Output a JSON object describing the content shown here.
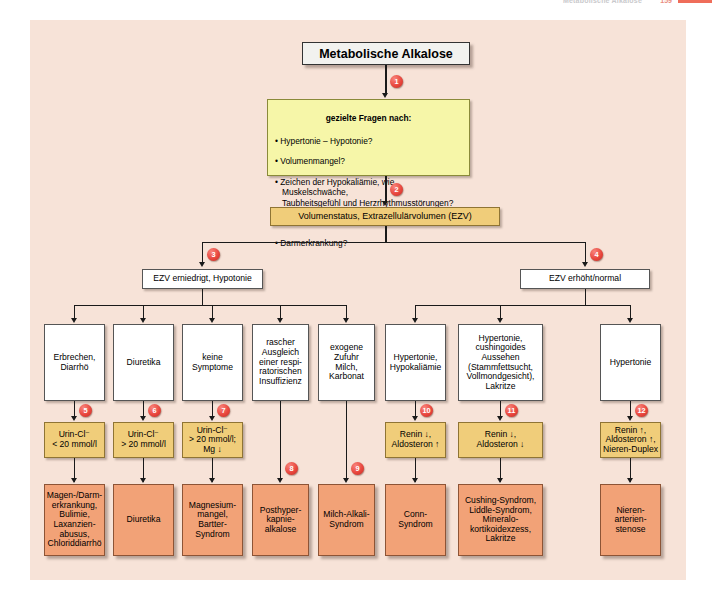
{
  "runhead": {
    "title": "Metabolische Alkalose",
    "page": "159"
  },
  "figure": {
    "title": "Metabolische Alkalose",
    "questions": {
      "heading": "gezielte Fragen nach:",
      "items": [
        "• Hypertonie – Hypotonie?",
        "• Volumenmangel?",
        "• Zeichen der Hypokaliämie, wie Muskelschwäche,\nTaubheitsgefühl und Herzrhythmusstörungen?",
        "• auslösende Medikamente?",
        "• Darmerkrankung?"
      ]
    },
    "volume_status": "Volumenstatus, Extrazellulärvolumen (EZV)",
    "branch_left": "EZV erniedrigt, Hypotonie",
    "branch_right": "EZV erhöht/normal",
    "findings": [
      "Erbrechen,\nDiarrhö",
      "Diuretika",
      "keine\nSymptome",
      "rascher\nAusgleich\neiner respi-\nratorischen\nInsuffizienz",
      "exogene\nZufuhr\nMilch,\nKarbonat",
      "Hypertonie,\nHypokaliämie",
      "Hypertonie,\ncushingoides\nAussehen\n(Stammfettsucht,\nVollmondgesicht),\nLakritze",
      "Hypertonie"
    ],
    "tests": [
      "Urin-Cl⁻\n< 20 mmol/l",
      "Urin-Cl⁻\n> 20 mmol/l",
      "Urin-Cl⁻\n> 20 mmol/l;\nMg ↓",
      "Renin ↓,\nAldosteron ↑",
      "Renin ↓,\nAldosteron ↓",
      "Renin ↑,\nAldosteron ↑,\nNieren-Duplex"
    ],
    "diagnoses": [
      "Magen-/Darm-\nerkrankung,\nBulimie,\nLaxanzien-\nabusus,\nChloriddiarrhö",
      "Diuretika",
      "Magnesium-\nmangel,\nBartter-\nSyndrom",
      "Posthyper-\nkapnie-\nalkalose",
      "Milch-Alkali-\nSyndrom",
      "Conn-\nSyndrom",
      "Cushing-Syndrom,\nLiddle-Syndrom,\nMineralo-\nkortikoidexzess,\nLakritze",
      "Nieren-\narterien-\nstenose"
    ],
    "badges": [
      "1",
      "2",
      "3",
      "4",
      "5",
      "6",
      "7",
      "8",
      "9",
      "10",
      "11",
      "12"
    ],
    "colors": {
      "page_background": "#f7e3d8",
      "question_box": "#f6f6a8",
      "test_box": "#f0cd7a",
      "diagnosis_box": "#f2a277",
      "badge": "#e8453c",
      "connector": "#1a1a1a"
    }
  }
}
